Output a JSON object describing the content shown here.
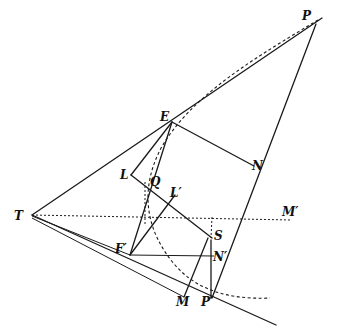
{
  "diagram": {
    "labels": {
      "P": "P",
      "E": "E",
      "N": "N",
      "L": "L",
      "Q": "Q",
      "L_prime": "L′",
      "M_prime": "M′",
      "T": "T",
      "S": "S",
      "F_prime": "F′",
      "N_prime": "N′",
      "M": "M",
      "P_prime": "P′"
    },
    "colors": {
      "ink": "#1a1a1a",
      "background": "#ffffff"
    }
  }
}
